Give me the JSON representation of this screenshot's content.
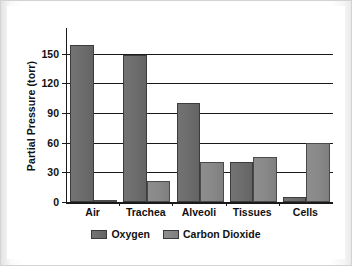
{
  "chart_data": {
    "type": "bar",
    "title": "",
    "xlabel": "",
    "ylabel": "Partial Pressure (torr)",
    "categories": [
      "Air",
      "Trachea",
      "Alveoli",
      "Tissues",
      "Cells"
    ],
    "series": [
      {
        "name": "Oxygen",
        "color": "#6c6c6c",
        "values": [
          159,
          149,
          100,
          40,
          5
        ]
      },
      {
        "name": "Carbon Dioxide",
        "color": "#888888",
        "values": [
          0.3,
          21,
          40,
          46,
          60
        ]
      }
    ],
    "ylim": [
      0,
      176
    ],
    "yticks": [
      0,
      30,
      60,
      90,
      120,
      150
    ],
    "ytick_labels": [
      "0",
      "30",
      "60",
      "90",
      "120",
      "150"
    ],
    "grid": true,
    "legend_position": "bottom",
    "legend_entries": [
      "Oxygen",
      "Carbon Dioxide"
    ]
  },
  "axis": {
    "y_title": "Partial Pressure (torr)",
    "tick_0": "0",
    "tick_30": "30",
    "tick_60": "60",
    "tick_90": "90",
    "tick_120": "120",
    "tick_150": "150"
  },
  "categories": {
    "c0": "Air",
    "c1": "Trachea",
    "c2": "Alveoli",
    "c3": "Tissues",
    "c4": "Cells"
  },
  "legend": {
    "oxygen": "Oxygen",
    "carbon_dioxide": "Carbon Dioxide"
  }
}
